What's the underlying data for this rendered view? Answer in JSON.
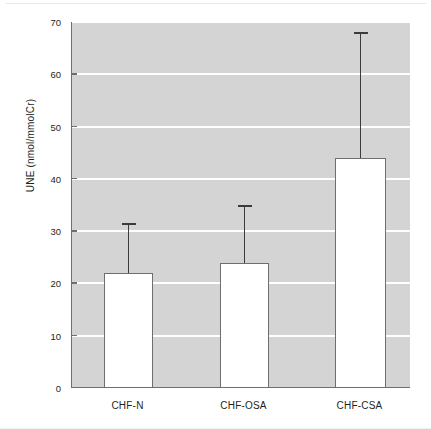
{
  "chart_data": {
    "type": "bar",
    "title": "",
    "subtitle": "",
    "xlabel": "",
    "ylabel": "UNE (nmol/mmolCr)",
    "categories": [
      "CHF-N",
      "CHF-OSA",
      "CHF-CSA"
    ],
    "values": [
      22,
      24,
      44
    ],
    "errors_upper": [
      9.5,
      11,
      24
    ],
    "error_tops": [
      31.5,
      35,
      68
    ],
    "ylim": [
      0,
      70
    ],
    "yticks": [
      0,
      10,
      20,
      30,
      40,
      50,
      60,
      70
    ],
    "ytick_labels": [
      "0",
      "10",
      "20",
      "30",
      "40",
      "50",
      "60",
      "70"
    ],
    "grid": "horizontal-white",
    "legend": "none",
    "error_bar_style": "upper-only-with-cap",
    "bar_fill": "#ffffff",
    "bar_edge": "#6e6e6e",
    "plot_background": "#d4d4d4",
    "gridline_color": "#ffffff",
    "axis_color": "#6e6e6e",
    "error_bar_color": "#3b3b3b",
    "text_color": "#231f20",
    "figure_background": "#ffffff"
  },
  "axis": {
    "y_title": "UNE (nmol/mmolCr)"
  }
}
